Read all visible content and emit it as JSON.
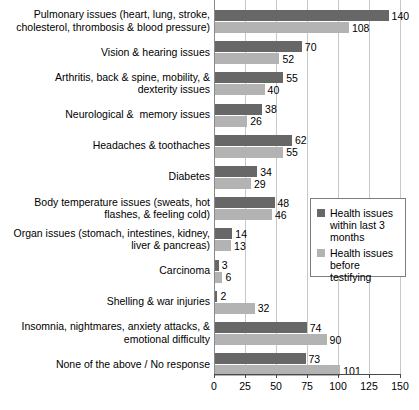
{
  "chart_data": {
    "type": "bar",
    "orientation": "horizontal",
    "title": "",
    "subtitle": "",
    "xlabel": "",
    "ylabel": "",
    "xlim": [
      0,
      150
    ],
    "xticks": [
      0,
      25,
      50,
      75,
      100,
      125,
      150
    ],
    "xtick_labels": [
      "0",
      "25",
      "50",
      "75",
      "100",
      "125",
      "150"
    ],
    "grid": "vertical",
    "legend_position": "middle-right",
    "categories": [
      "Pulmonary issues (heart, lung, stroke,\ncholesterol, thrombosis & blood pressure)",
      "Vision & hearing issues",
      "Arthritis, back & spine, mobility, &\ndexterity issues",
      "Neurological &  memory issues",
      "Headaches & toothaches",
      "Diabetes",
      "Body temperature issues (sweats, hot\nflashes, & feeling cold)",
      "Organ issues (stomach, intestines, kidney,\nliver & pancreas)",
      "Carcinoma",
      "Shelling & war injuries",
      "Insomnia, nightmares, anxiety attacks, &\nemotional difficulty",
      "None of the above / No response"
    ],
    "series": [
      {
        "name": "Health issues within last 3 months",
        "color": "#676767",
        "values": [
          140,
          70,
          55,
          38,
          62,
          34,
          48,
          14,
          3,
          2,
          74,
          73
        ]
      },
      {
        "name": "Health issues before testifying",
        "color": "#b3b3b3",
        "values": [
          108,
          52,
          40,
          26,
          55,
          29,
          46,
          13,
          6,
          32,
          90,
          101
        ]
      }
    ]
  },
  "legend": {
    "entries": [
      {
        "label": "Health issues within last 3 months",
        "color": "#676767"
      },
      {
        "label": "Health issues before testifying",
        "color": "#b3b3b3"
      }
    ]
  },
  "colors": {
    "series_dark": "#676767",
    "series_light": "#b3b3b3",
    "gridline": "#c8c8c8",
    "axis": "#4a4a4a",
    "text": "#000000",
    "background": "#ffffff"
  }
}
